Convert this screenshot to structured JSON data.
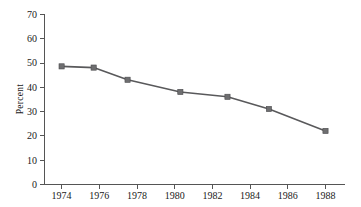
{
  "chart_data": {
    "type": "line",
    "title": "",
    "xlabel": "",
    "ylabel": "Percent",
    "xlim": [
      1973,
      1989
    ],
    "ylim": [
      0,
      70
    ],
    "ytick_step": 10,
    "xtick_step": 2,
    "grid": false,
    "legend": "none",
    "series": [
      {
        "name": "Percent",
        "color": "#59595b",
        "marker": "square",
        "x": [
          1974,
          1975.7,
          1977.5,
          1980.3,
          1982.8,
          1985.0,
          1988.0
        ],
        "values": [
          48.5,
          48.0,
          43.0,
          38.0,
          36.0,
          31.0,
          22.0
        ]
      }
    ],
    "x_tick_labels": [
      "1974",
      "1976",
      "1978",
      "1980",
      "1982",
      "1984",
      "1986",
      "1988"
    ],
    "x_tick_values": [
      1974,
      1976,
      1978,
      1980,
      1982,
      1984,
      1986,
      1988
    ],
    "y_tick_labels": [
      "0",
      "10",
      "20",
      "30",
      "40",
      "50",
      "60",
      "70"
    ],
    "y_tick_values": [
      0,
      10,
      20,
      30,
      40,
      50,
      60,
      70
    ]
  },
  "axis": {
    "y_title": "Percent"
  },
  "ticks": {
    "y": {
      "t0": "0",
      "t1": "10",
      "t2": "20",
      "t3": "30",
      "t4": "40",
      "t5": "50",
      "t6": "60",
      "t7": "70"
    },
    "x": {
      "t0": "1974",
      "t1": "1976",
      "t2": "1978",
      "t3": "1980",
      "t4": "1982",
      "t5": "1984",
      "t6": "1986",
      "t7": "1988"
    }
  }
}
